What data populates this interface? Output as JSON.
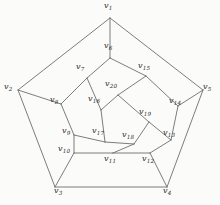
{
  "figure": {
    "background_color": "#fbfbf9",
    "edge_color": "#6e6e6e",
    "label_color": "#2b2b2b",
    "width": 220,
    "height": 205
  },
  "graph": {
    "vertex_count": 20,
    "edge_count": 30,
    "label_prefix": "v",
    "vertices": [
      {
        "id": "v1",
        "name": "v",
        "sub": "1",
        "x": 110,
        "y": 18,
        "label_x": 104,
        "label_y": 2,
        "ring": "outer"
      },
      {
        "id": "v2",
        "name": "v",
        "sub": "2",
        "x": 18,
        "y": 90,
        "label_x": 4,
        "label_y": 83,
        "ring": "outer"
      },
      {
        "id": "v3",
        "name": "v",
        "sub": "3",
        "x": 55,
        "y": 187,
        "label_x": 54,
        "label_y": 187,
        "ring": "outer"
      },
      {
        "id": "v4",
        "name": "v",
        "sub": "4",
        "x": 167,
        "y": 187,
        "label_x": 163,
        "label_y": 187,
        "ring": "outer"
      },
      {
        "id": "v5",
        "name": "v",
        "sub": "5",
        "x": 203,
        "y": 90,
        "label_x": 203,
        "label_y": 83,
        "ring": "outer"
      },
      {
        "id": "v6",
        "name": "v",
        "sub": "6",
        "x": 110,
        "y": 58,
        "label_x": 104,
        "label_y": 42,
        "ring": "middle"
      },
      {
        "id": "v7",
        "name": "v",
        "sub": "7",
        "x": 87,
        "y": 78,
        "label_x": 76,
        "label_y": 63,
        "ring": "middle"
      },
      {
        "id": "v8",
        "name": "v",
        "sub": "8",
        "x": 61,
        "y": 104,
        "label_x": 50,
        "label_y": 96,
        "ring": "middle"
      },
      {
        "id": "v9",
        "name": "v",
        "sub": "9",
        "x": 74,
        "y": 135,
        "label_x": 62,
        "label_y": 127,
        "ring": "middle"
      },
      {
        "id": "v10",
        "name": "v",
        "sub": "10",
        "x": 74,
        "y": 153,
        "label_x": 58,
        "label_y": 145,
        "ring": "middle"
      },
      {
        "id": "v11",
        "name": "v",
        "sub": "11",
        "x": 113,
        "y": 153,
        "label_x": 104,
        "label_y": 155,
        "ring": "middle"
      },
      {
        "id": "v12",
        "name": "v",
        "sub": "12",
        "x": 150,
        "y": 153,
        "label_x": 142,
        "label_y": 155,
        "ring": "middle"
      },
      {
        "id": "v13",
        "name": "v",
        "sub": "13",
        "x": 171,
        "y": 140,
        "label_x": 163,
        "label_y": 129,
        "ring": "middle"
      },
      {
        "id": "v14",
        "name": "v",
        "sub": "14",
        "x": 178,
        "y": 106,
        "label_x": 169,
        "label_y": 97,
        "ring": "middle"
      },
      {
        "id": "v15",
        "name": "v",
        "sub": "15",
        "x": 146,
        "y": 76,
        "label_x": 138,
        "label_y": 62,
        "ring": "middle"
      },
      {
        "id": "v16",
        "name": "v",
        "sub": "16",
        "x": 101,
        "y": 110,
        "label_x": 88,
        "label_y": 95,
        "ring": "inner"
      },
      {
        "id": "v17",
        "name": "v",
        "sub": "17",
        "x": 105,
        "y": 142,
        "label_x": 92,
        "label_y": 127,
        "ring": "inner"
      },
      {
        "id": "v18",
        "name": "v",
        "sub": "18",
        "x": 134,
        "y": 144,
        "label_x": 122,
        "label_y": 131,
        "ring": "inner"
      },
      {
        "id": "v19",
        "name": "v",
        "sub": "19",
        "x": 149,
        "y": 122,
        "label_x": 139,
        "label_y": 108,
        "ring": "inner"
      },
      {
        "id": "v20",
        "name": "v",
        "sub": "20",
        "x": 118,
        "y": 95,
        "label_x": 105,
        "label_y": 80,
        "ring": "inner"
      }
    ],
    "edges": [
      {
        "from": "v1",
        "to": "v2",
        "group": "outer-pentagon"
      },
      {
        "from": "v2",
        "to": "v3",
        "group": "outer-pentagon"
      },
      {
        "from": "v3",
        "to": "v4",
        "group": "outer-pentagon"
      },
      {
        "from": "v4",
        "to": "v5",
        "group": "outer-pentagon"
      },
      {
        "from": "v5",
        "to": "v1",
        "group": "outer-pentagon"
      },
      {
        "from": "v1",
        "to": "v6",
        "group": "outer-spoke"
      },
      {
        "from": "v2",
        "to": "v8",
        "group": "outer-spoke"
      },
      {
        "from": "v3",
        "to": "v10",
        "group": "outer-spoke"
      },
      {
        "from": "v4",
        "to": "v12",
        "group": "outer-spoke"
      },
      {
        "from": "v5",
        "to": "v14",
        "group": "outer-spoke"
      },
      {
        "from": "v6",
        "to": "v7",
        "group": "middle-decagon"
      },
      {
        "from": "v7",
        "to": "v8",
        "group": "middle-decagon"
      },
      {
        "from": "v8",
        "to": "v9",
        "group": "middle-decagon"
      },
      {
        "from": "v9",
        "to": "v10",
        "group": "middle-decagon"
      },
      {
        "from": "v10",
        "to": "v11",
        "group": "middle-decagon"
      },
      {
        "from": "v11",
        "to": "v12",
        "group": "middle-decagon"
      },
      {
        "from": "v12",
        "to": "v13",
        "group": "middle-decagon"
      },
      {
        "from": "v13",
        "to": "v14",
        "group": "middle-decagon"
      },
      {
        "from": "v14",
        "to": "v15",
        "group": "middle-decagon"
      },
      {
        "from": "v15",
        "to": "v6",
        "group": "middle-decagon"
      },
      {
        "from": "v7",
        "to": "v16",
        "group": "inner-spoke"
      },
      {
        "from": "v9",
        "to": "v17",
        "group": "inner-spoke"
      },
      {
        "from": "v11",
        "to": "v18",
        "group": "inner-spoke"
      },
      {
        "from": "v13",
        "to": "v19",
        "group": "inner-spoke"
      },
      {
        "from": "v15",
        "to": "v20",
        "group": "inner-spoke"
      },
      {
        "from": "v16",
        "to": "v20",
        "group": "inner-pentagon"
      },
      {
        "from": "v20",
        "to": "v19",
        "group": "inner-pentagon"
      },
      {
        "from": "v19",
        "to": "v18",
        "group": "inner-pentagon"
      },
      {
        "from": "v18",
        "to": "v17",
        "group": "inner-pentagon"
      },
      {
        "from": "v17",
        "to": "v16",
        "group": "inner-pentagon"
      }
    ]
  }
}
